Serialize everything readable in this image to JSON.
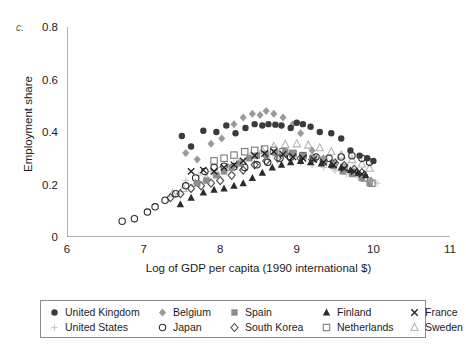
{
  "figure": {
    "panel_label": "c.",
    "background": "#ffffff"
  },
  "axes": {
    "x": {
      "label": "Log of GDP per capita (1990 international $)",
      "ticks": [
        "6",
        "7",
        "8",
        "9",
        "10",
        "11"
      ],
      "min": 6,
      "max": 11
    },
    "y": {
      "label": "Employment share",
      "ticks": [
        "0",
        "0.2",
        "0.4",
        "0.6",
        "0.8"
      ],
      "min": 0,
      "max": 0.8
    }
  },
  "legend": {
    "entries": [
      {
        "label": "United Kingdom",
        "marker": "filled-circle",
        "color": "#3a3a3a"
      },
      {
        "label": "Belgium",
        "marker": "filled-diamond",
        "color": "#9a9a9a"
      },
      {
        "label": "Spain",
        "marker": "filled-square",
        "color": "#8c8c8c"
      },
      {
        "label": "Finland",
        "marker": "filled-triangle",
        "color": "#2b2b2b"
      },
      {
        "label": "France",
        "marker": "cross",
        "color": "#1f1f1f"
      },
      {
        "label": "United States",
        "marker": "plus",
        "color": "#c8c8c8"
      },
      {
        "label": "Japan",
        "marker": "open-circle",
        "color": "#2b2b2b"
      },
      {
        "label": "South Korea",
        "marker": "open-diamond",
        "color": "#4a4a4a"
      },
      {
        "label": "Netherlands",
        "marker": "open-square",
        "color": "#7a7a7a"
      },
      {
        "label": "Sweden",
        "marker": "open-triangle",
        "color": "#b4b4b4"
      }
    ]
  },
  "chart_data": {
    "type": "scatter",
    "title": "",
    "xlabel": "Log of GDP per capita (1990 international $)",
    "ylabel": "Employment share",
    "xlim": [
      6,
      11
    ],
    "ylim": [
      0,
      0.8
    ],
    "grid": false,
    "legend_position": "below-axes",
    "series": [
      {
        "name": "United Kingdom",
        "marker": "filled-circle",
        "color": "#3a3a3a",
        "points": [
          [
            7.5,
            0.385
          ],
          [
            7.62,
            0.345
          ],
          [
            7.78,
            0.405
          ],
          [
            7.95,
            0.4
          ],
          [
            8.08,
            0.425
          ],
          [
            8.2,
            0.395
          ],
          [
            8.33,
            0.415
          ],
          [
            8.45,
            0.43
          ],
          [
            8.55,
            0.425
          ],
          [
            8.63,
            0.43
          ],
          [
            8.72,
            0.428
          ],
          [
            8.8,
            0.425
          ],
          [
            8.92,
            0.415
          ],
          [
            9.0,
            0.435
          ],
          [
            9.08,
            0.43
          ],
          [
            9.18,
            0.42
          ],
          [
            9.3,
            0.4
          ],
          [
            9.45,
            0.395
          ],
          [
            9.58,
            0.375
          ],
          [
            9.7,
            0.33
          ],
          [
            9.82,
            0.31
          ],
          [
            9.92,
            0.3
          ],
          [
            10.0,
            0.29
          ]
        ]
      },
      {
        "name": "Belgium",
        "marker": "filled-diamond",
        "color": "#9a9a9a",
        "points": [
          [
            7.55,
            0.32
          ],
          [
            7.7,
            0.295
          ],
          [
            7.88,
            0.355
          ],
          [
            8.02,
            0.375
          ],
          [
            8.18,
            0.43
          ],
          [
            8.3,
            0.455
          ],
          [
            8.42,
            0.47
          ],
          [
            8.52,
            0.465
          ],
          [
            8.6,
            0.48
          ],
          [
            8.7,
            0.47
          ],
          [
            8.82,
            0.455
          ],
          [
            8.95,
            0.43
          ],
          [
            9.05,
            0.395
          ],
          [
            9.2,
            0.33
          ],
          [
            9.35,
            0.3
          ],
          [
            9.5,
            0.28
          ],
          [
            9.62,
            0.26
          ],
          [
            9.75,
            0.25
          ],
          [
            9.88,
            0.235
          ],
          [
            9.97,
            0.215
          ]
        ]
      },
      {
        "name": "Spain",
        "marker": "filled-square",
        "color": "#8c8c8c",
        "points": [
          [
            7.7,
            0.205
          ],
          [
            7.82,
            0.215
          ],
          [
            7.95,
            0.235
          ],
          [
            8.05,
            0.25
          ],
          [
            8.15,
            0.265
          ],
          [
            8.25,
            0.28
          ],
          [
            8.38,
            0.3
          ],
          [
            8.48,
            0.31
          ],
          [
            8.6,
            0.315
          ],
          [
            8.72,
            0.32
          ],
          [
            8.85,
            0.325
          ],
          [
            8.95,
            0.32
          ],
          [
            9.08,
            0.31
          ],
          [
            9.2,
            0.3
          ],
          [
            9.35,
            0.285
          ],
          [
            9.48,
            0.27
          ],
          [
            9.6,
            0.25
          ],
          [
            9.72,
            0.24
          ],
          [
            9.85,
            0.225
          ],
          [
            9.95,
            0.205
          ]
        ]
      },
      {
        "name": "Finland",
        "marker": "filled-triangle",
        "color": "#2b2b2b",
        "points": [
          [
            7.48,
            0.125
          ],
          [
            7.62,
            0.15
          ],
          [
            7.78,
            0.17
          ],
          [
            7.92,
            0.18
          ],
          [
            8.05,
            0.185
          ],
          [
            8.18,
            0.195
          ],
          [
            8.3,
            0.205
          ],
          [
            8.42,
            0.225
          ],
          [
            8.55,
            0.245
          ],
          [
            8.68,
            0.265
          ],
          [
            8.8,
            0.275
          ],
          [
            8.92,
            0.285
          ],
          [
            9.05,
            0.29
          ],
          [
            9.18,
            0.285
          ],
          [
            9.32,
            0.28
          ],
          [
            9.45,
            0.275
          ],
          [
            9.58,
            0.265
          ],
          [
            9.7,
            0.255
          ],
          [
            9.8,
            0.245
          ],
          [
            9.9,
            0.235
          ]
        ]
      },
      {
        "name": "France",
        "marker": "cross",
        "color": "#1f1f1f",
        "points": [
          [
            7.62,
            0.25
          ],
          [
            7.78,
            0.255
          ],
          [
            7.92,
            0.25
          ],
          [
            8.05,
            0.265
          ],
          [
            8.18,
            0.275
          ],
          [
            8.3,
            0.29
          ],
          [
            8.45,
            0.31
          ],
          [
            8.58,
            0.318
          ],
          [
            8.7,
            0.325
          ],
          [
            8.82,
            0.315
          ],
          [
            8.95,
            0.305
          ],
          [
            9.08,
            0.3
          ],
          [
            9.22,
            0.295
          ],
          [
            9.35,
            0.285
          ],
          [
            9.48,
            0.275
          ],
          [
            9.62,
            0.262
          ],
          [
            9.75,
            0.25
          ],
          [
            9.85,
            0.24
          ]
        ]
      },
      {
        "name": "United States",
        "marker": "plus",
        "color": "#c8c8c8",
        "points": [
          [
            7.55,
            0.215
          ],
          [
            7.72,
            0.235
          ],
          [
            7.88,
            0.25
          ],
          [
            8.02,
            0.265
          ],
          [
            8.18,
            0.28
          ],
          [
            8.32,
            0.292
          ],
          [
            8.48,
            0.3
          ],
          [
            8.62,
            0.305
          ],
          [
            8.78,
            0.3
          ],
          [
            8.92,
            0.292
          ],
          [
            9.05,
            0.285
          ],
          [
            9.2,
            0.275
          ],
          [
            9.35,
            0.265
          ],
          [
            9.5,
            0.252
          ],
          [
            9.65,
            0.24
          ],
          [
            9.8,
            0.228
          ],
          [
            9.95,
            0.215
          ],
          [
            10.05,
            0.205
          ]
        ]
      },
      {
        "name": "Japan",
        "marker": "open-circle",
        "color": "#2b2b2b",
        "points": [
          [
            6.72,
            0.06
          ],
          [
            6.88,
            0.07
          ],
          [
            7.05,
            0.095
          ],
          [
            7.15,
            0.115
          ],
          [
            7.28,
            0.14
          ],
          [
            7.42,
            0.165
          ],
          [
            7.55,
            0.195
          ],
          [
            7.68,
            0.225
          ],
          [
            7.8,
            0.25
          ],
          [
            7.92,
            0.265
          ],
          [
            8.05,
            0.27
          ],
          [
            8.18,
            0.268
          ],
          [
            8.32,
            0.265
          ],
          [
            8.48,
            0.275
          ],
          [
            8.62,
            0.285
          ],
          [
            8.78,
            0.3
          ],
          [
            8.92,
            0.305
          ],
          [
            9.08,
            0.31
          ],
          [
            9.25,
            0.305
          ],
          [
            9.42,
            0.3
          ],
          [
            9.58,
            0.305
          ],
          [
            9.72,
            0.31
          ],
          [
            9.85,
            0.3
          ],
          [
            9.95,
            0.285
          ]
        ]
      },
      {
        "name": "South Korea",
        "marker": "open-diamond",
        "color": "#4a4a4a",
        "points": [
          [
            7.35,
            0.15
          ],
          [
            7.48,
            0.165
          ],
          [
            7.62,
            0.185
          ],
          [
            7.75,
            0.195
          ],
          [
            7.88,
            0.205
          ],
          [
            8.0,
            0.215
          ],
          [
            8.15,
            0.235
          ],
          [
            8.3,
            0.255
          ],
          [
            8.45,
            0.275
          ],
          [
            8.6,
            0.29
          ],
          [
            8.75,
            0.3
          ],
          [
            8.9,
            0.305
          ],
          [
            9.05,
            0.3
          ],
          [
            9.2,
            0.295
          ],
          [
            9.35,
            0.29
          ],
          [
            9.5,
            0.282
          ],
          [
            9.62,
            0.272
          ],
          [
            9.75,
            0.258
          ],
          [
            9.85,
            0.245
          ]
        ]
      },
      {
        "name": "Netherlands",
        "marker": "open-square",
        "color": "#7a7a7a",
        "points": [
          [
            7.92,
            0.29
          ],
          [
            8.05,
            0.3
          ],
          [
            8.18,
            0.312
          ],
          [
            8.32,
            0.325
          ],
          [
            8.45,
            0.33
          ],
          [
            8.58,
            0.335
          ],
          [
            8.7,
            0.33
          ],
          [
            8.82,
            0.325
          ],
          [
            8.95,
            0.318
          ],
          [
            9.08,
            0.31
          ],
          [
            9.22,
            0.3
          ],
          [
            9.35,
            0.292
          ],
          [
            9.48,
            0.28
          ],
          [
            9.62,
            0.265
          ],
          [
            9.75,
            0.245
          ],
          [
            9.88,
            0.225
          ],
          [
            9.98,
            0.205
          ]
        ]
      },
      {
        "name": "Sweden",
        "marker": "open-triangle",
        "color": "#b4b4b4",
        "points": [
          [
            7.38,
            0.165
          ],
          [
            7.52,
            0.185
          ],
          [
            7.68,
            0.205
          ],
          [
            7.82,
            0.225
          ],
          [
            7.95,
            0.245
          ],
          [
            8.1,
            0.265
          ],
          [
            8.25,
            0.285
          ],
          [
            8.4,
            0.31
          ],
          [
            8.55,
            0.33
          ],
          [
            8.7,
            0.345
          ],
          [
            8.85,
            0.352
          ],
          [
            9.0,
            0.355
          ],
          [
            9.15,
            0.35
          ],
          [
            9.3,
            0.34
          ],
          [
            9.45,
            0.325
          ],
          [
            9.58,
            0.312
          ],
          [
            9.72,
            0.295
          ],
          [
            9.85,
            0.278
          ],
          [
            9.95,
            0.262
          ]
        ]
      }
    ]
  }
}
